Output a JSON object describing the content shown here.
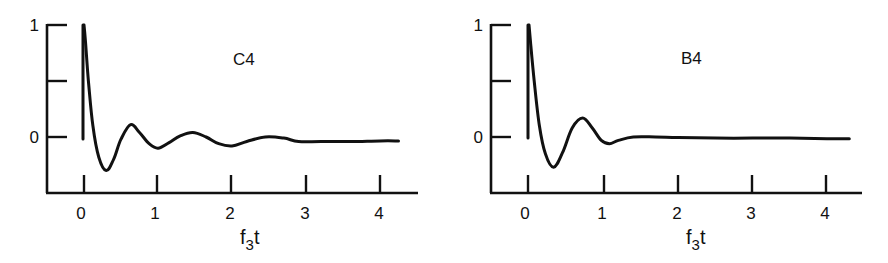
{
  "chart_data": [
    {
      "type": "line",
      "title": "C4",
      "panel_label": "C4",
      "xlabel": "f3t",
      "xlabel_main": "f",
      "xlabel_sub": "3",
      "xlabel_tail": "t",
      "ylabel": "",
      "xlim": [
        -0.45,
        4.5
      ],
      "ylim": [
        -0.5,
        1
      ],
      "x_ticks": [
        0,
        1,
        2,
        3,
        4
      ],
      "x_tick_labels": [
        "0",
        "1",
        "2",
        "3",
        "4"
      ],
      "y_ticks": [
        0,
        0.5,
        1
      ],
      "y_tick_labels": [
        "0",
        "",
        "1"
      ],
      "grid": false,
      "legend": null,
      "series": [
        {
          "name": "C4",
          "x": [
            0,
            0.02,
            0.06,
            0.12,
            0.2,
            0.3,
            0.4,
            0.5,
            0.63,
            0.75,
            0.88,
            1.0,
            1.15,
            1.3,
            1.47,
            1.65,
            1.82,
            2.0,
            2.2,
            2.45,
            2.7,
            2.9,
            3.2,
            3.6,
            4.0,
            4.25
          ],
          "y": [
            1.0,
            0.85,
            0.5,
            0.1,
            -0.18,
            -0.3,
            -0.2,
            -0.02,
            0.11,
            0.04,
            -0.06,
            -0.1,
            -0.05,
            0.01,
            0.04,
            0.0,
            -0.06,
            -0.08,
            -0.04,
            0.0,
            -0.01,
            -0.04,
            -0.04,
            -0.04,
            -0.035,
            -0.035
          ]
        }
      ],
      "annotations": [
        "vertical marker line at f3t = 0 from y = 1 to y = 0"
      ]
    },
    {
      "type": "line",
      "title": "B4",
      "panel_label": "B4",
      "xlabel": "f3t",
      "xlabel_main": "f",
      "xlabel_sub": "3",
      "xlabel_tail": "t",
      "ylabel": "",
      "xlim": [
        -0.45,
        4.5
      ],
      "ylim": [
        -0.5,
        1
      ],
      "x_ticks": [
        0,
        1,
        2,
        3,
        4
      ],
      "x_tick_labels": [
        "0",
        "1",
        "2",
        "3",
        "4"
      ],
      "y_ticks": [
        0,
        0.5,
        1
      ],
      "y_tick_labels": [
        "0",
        "",
        "1"
      ],
      "grid": false,
      "legend": null,
      "series": [
        {
          "name": "B4",
          "x": [
            0,
            0.02,
            0.07,
            0.14,
            0.22,
            0.33,
            0.45,
            0.58,
            0.72,
            0.85,
            0.97,
            1.08,
            1.2,
            1.4,
            1.7,
            2.0,
            2.5,
            3.0,
            3.5,
            4.0,
            4.3
          ],
          "y": [
            1.0,
            0.85,
            0.5,
            0.1,
            -0.15,
            -0.27,
            -0.14,
            0.08,
            0.17,
            0.08,
            -0.03,
            -0.06,
            -0.03,
            0.0,
            0.0,
            -0.005,
            -0.01,
            -0.01,
            -0.01,
            -0.015,
            -0.015
          ]
        }
      ],
      "annotations": [
        "vertical marker line at f3t = 0 from y = 1 to y = 0"
      ]
    }
  ],
  "panels": [
    {
      "label": "C4",
      "xlabel": {
        "main": "f",
        "sub": "3",
        "tail": "t"
      },
      "x_tick_labels": [
        "0",
        "1",
        "2",
        "3",
        "4"
      ],
      "y_tick_labels": {
        "top": "1",
        "zero": "0"
      }
    },
    {
      "label": "B4",
      "xlabel": {
        "main": "f",
        "sub": "3",
        "tail": "t"
      },
      "x_tick_labels": [
        "0",
        "1",
        "2",
        "3",
        "4"
      ],
      "y_tick_labels": {
        "top": "1",
        "zero": "0"
      }
    }
  ]
}
